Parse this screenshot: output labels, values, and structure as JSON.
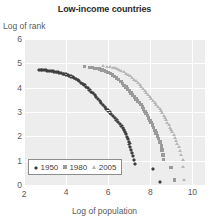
{
  "chart_data": {
    "type": "scatter",
    "title": "Low-income countries",
    "xlabel": "Log of population",
    "ylabel": "Log of rank",
    "xlim": [
      2,
      10.6
    ],
    "ylim": [
      0,
      6
    ],
    "xticks": [
      2,
      4,
      6,
      8,
      10
    ],
    "yticks": [
      0,
      1,
      2,
      3,
      4,
      5,
      6
    ],
    "grid": true,
    "legend_position": "bottom-left",
    "colors": {
      "1950": "#3f3f3f",
      "1980": "#9a9a9a",
      "2005": "#b6b6b6",
      "plot_background": "#ededed",
      "gridline": "#ffffff",
      "text": "#5a5a5a",
      "title": "#2b2b2b"
    },
    "series": [
      {
        "name": "1950",
        "marker": "diamond",
        "color": "#3f3f3f",
        "points": [
          [
            2.72,
            4.82
          ],
          [
            2.8,
            4.81
          ],
          [
            2.88,
            4.8
          ],
          [
            2.96,
            4.8
          ],
          [
            3.04,
            4.79
          ],
          [
            3.12,
            4.78
          ],
          [
            3.2,
            4.77
          ],
          [
            3.28,
            4.76
          ],
          [
            3.36,
            4.75
          ],
          [
            3.44,
            4.74
          ],
          [
            3.52,
            4.73
          ],
          [
            3.6,
            4.71
          ],
          [
            3.68,
            4.7
          ],
          [
            3.76,
            4.68
          ],
          [
            3.84,
            4.66
          ],
          [
            3.92,
            4.64
          ],
          [
            4.0,
            4.62
          ],
          [
            4.08,
            4.6
          ],
          [
            4.16,
            4.57
          ],
          [
            4.24,
            4.54
          ],
          [
            4.32,
            4.51
          ],
          [
            4.4,
            4.47
          ],
          [
            4.48,
            4.43
          ],
          [
            4.56,
            4.39
          ],
          [
            4.64,
            4.34
          ],
          [
            4.72,
            4.29
          ],
          [
            4.8,
            4.24
          ],
          [
            4.88,
            4.18
          ],
          [
            4.96,
            4.12
          ],
          [
            5.04,
            4.06
          ],
          [
            5.12,
            3.99
          ],
          [
            5.2,
            3.92
          ],
          [
            5.28,
            3.85
          ],
          [
            5.36,
            3.78
          ],
          [
            5.44,
            3.7
          ],
          [
            5.52,
            3.62
          ],
          [
            5.6,
            3.54
          ],
          [
            5.68,
            3.46
          ],
          [
            5.76,
            3.38
          ],
          [
            5.84,
            3.3
          ],
          [
            5.92,
            3.22
          ],
          [
            6.0,
            3.14
          ],
          [
            6.08,
            3.06
          ],
          [
            6.16,
            2.98
          ],
          [
            6.24,
            2.9
          ],
          [
            6.32,
            2.82
          ],
          [
            6.4,
            2.74
          ],
          [
            6.48,
            2.66
          ],
          [
            6.56,
            2.58
          ],
          [
            6.64,
            2.5
          ],
          [
            6.7,
            2.42
          ],
          [
            6.76,
            2.34
          ],
          [
            6.8,
            2.25
          ],
          [
            6.86,
            2.16
          ],
          [
            6.9,
            2.06
          ],
          [
            6.94,
            1.96
          ],
          [
            6.98,
            1.86
          ],
          [
            7.02,
            1.75
          ],
          [
            7.06,
            1.64
          ],
          [
            7.1,
            1.52
          ],
          [
            7.14,
            1.4
          ],
          [
            7.18,
            1.26
          ],
          [
            7.22,
            1.1
          ],
          [
            7.26,
            0.95
          ],
          [
            8.12,
            0.72
          ],
          [
            8.46,
            0.2
          ]
        ]
      },
      {
        "name": "1980",
        "marker": "square",
        "color": "#9a9a9a",
        "points": [
          [
            4.86,
            4.86
          ],
          [
            5.1,
            4.84
          ],
          [
            5.25,
            4.82
          ],
          [
            5.38,
            4.8
          ],
          [
            5.5,
            4.78
          ],
          [
            5.6,
            4.76
          ],
          [
            5.7,
            4.73
          ],
          [
            5.8,
            4.7
          ],
          [
            5.9,
            4.66
          ],
          [
            6.0,
            4.62
          ],
          [
            6.1,
            4.57
          ],
          [
            6.2,
            4.52
          ],
          [
            6.3,
            4.46
          ],
          [
            6.4,
            4.4
          ],
          [
            6.5,
            4.33
          ],
          [
            6.6,
            4.26
          ],
          [
            6.68,
            4.18
          ],
          [
            6.76,
            4.1
          ],
          [
            6.84,
            4.02
          ],
          [
            6.92,
            3.94
          ],
          [
            7.0,
            3.86
          ],
          [
            7.08,
            3.78
          ],
          [
            7.16,
            3.7
          ],
          [
            7.24,
            3.62
          ],
          [
            7.32,
            3.54
          ],
          [
            7.4,
            3.46
          ],
          [
            7.48,
            3.38
          ],
          [
            7.56,
            3.3
          ],
          [
            7.62,
            3.21
          ],
          [
            7.68,
            3.12
          ],
          [
            7.74,
            3.03
          ],
          [
            7.8,
            2.94
          ],
          [
            7.86,
            2.85
          ],
          [
            7.92,
            2.76
          ],
          [
            7.98,
            2.66
          ],
          [
            8.04,
            2.56
          ],
          [
            8.1,
            2.46
          ],
          [
            8.16,
            2.36
          ],
          [
            8.22,
            2.25
          ],
          [
            8.28,
            2.14
          ],
          [
            8.34,
            2.02
          ],
          [
            8.4,
            1.9
          ],
          [
            8.46,
            1.76
          ],
          [
            8.52,
            1.6
          ],
          [
            8.56,
            1.44
          ],
          [
            8.6,
            1.24
          ],
          [
            8.64,
            1.06
          ],
          [
            8.98,
            0.72
          ],
          [
            9.14,
            0.2
          ]
        ]
      },
      {
        "name": "2005",
        "marker": "triangle",
        "color": "#b6b6b6",
        "points": [
          [
            5.78,
            4.88
          ],
          [
            5.95,
            4.86
          ],
          [
            6.1,
            4.84
          ],
          [
            6.22,
            4.82
          ],
          [
            6.34,
            4.79
          ],
          [
            6.44,
            4.76
          ],
          [
            6.54,
            4.72
          ],
          [
            6.64,
            4.68
          ],
          [
            6.74,
            4.63
          ],
          [
            6.84,
            4.58
          ],
          [
            6.94,
            4.52
          ],
          [
            7.04,
            4.46
          ],
          [
            7.14,
            4.4
          ],
          [
            7.24,
            4.33
          ],
          [
            7.34,
            4.26
          ],
          [
            7.42,
            4.18
          ],
          [
            7.5,
            4.1
          ],
          [
            7.58,
            4.02
          ],
          [
            7.66,
            3.94
          ],
          [
            7.74,
            3.86
          ],
          [
            7.82,
            3.78
          ],
          [
            7.9,
            3.7
          ],
          [
            7.98,
            3.62
          ],
          [
            8.06,
            3.54
          ],
          [
            8.14,
            3.46
          ],
          [
            8.22,
            3.38
          ],
          [
            8.3,
            3.3
          ],
          [
            8.38,
            3.21
          ],
          [
            8.46,
            3.12
          ],
          [
            8.52,
            3.03
          ],
          [
            8.58,
            2.94
          ],
          [
            8.64,
            2.85
          ],
          [
            8.7,
            2.76
          ],
          [
            8.76,
            2.66
          ],
          [
            8.82,
            2.56
          ],
          [
            8.88,
            2.46
          ],
          [
            8.94,
            2.36
          ],
          [
            9.0,
            2.26
          ],
          [
            9.06,
            2.16
          ],
          [
            9.12,
            2.05
          ],
          [
            9.18,
            1.94
          ],
          [
            9.24,
            1.82
          ],
          [
            9.3,
            1.7
          ],
          [
            9.36,
            1.56
          ],
          [
            9.42,
            1.4
          ],
          [
            9.48,
            1.22
          ],
          [
            9.54,
            1.04
          ],
          [
            9.56,
            0.72
          ],
          [
            9.62,
            0.2
          ]
        ]
      }
    ]
  }
}
